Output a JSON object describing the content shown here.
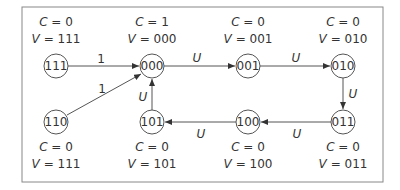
{
  "diagram": {
    "type": "state-transition",
    "frame": {
      "x": 22,
      "y": 7,
      "width": 361,
      "height": 175,
      "stroke": "#888888"
    },
    "nodes": [
      {
        "id": "111",
        "label": "111",
        "x": 56,
        "y": 66,
        "c": "C = 0",
        "v": "V = 111",
        "annot_pos": "above"
      },
      {
        "id": "000",
        "label": "000",
        "x": 152,
        "y": 66,
        "c": "C = 1",
        "v": "V = 000",
        "annot_pos": "above"
      },
      {
        "id": "001",
        "label": "001",
        "x": 248,
        "y": 66,
        "c": "C = 0",
        "v": "V = 001",
        "annot_pos": "above"
      },
      {
        "id": "010",
        "label": "010",
        "x": 343,
        "y": 66,
        "c": "C = 0",
        "v": "V = 010",
        "annot_pos": "above"
      },
      {
        "id": "110",
        "label": "110",
        "x": 56,
        "y": 122,
        "c": "C = 0",
        "v": "V = 111",
        "annot_pos": "below"
      },
      {
        "id": "101",
        "label": "101",
        "x": 152,
        "y": 122,
        "c": "C = 0",
        "v": "V = 101",
        "annot_pos": "below"
      },
      {
        "id": "100",
        "label": "100",
        "x": 248,
        "y": 122,
        "c": "C = 0",
        "v": "V = 100",
        "annot_pos": "below"
      },
      {
        "id": "011",
        "label": "011",
        "x": 343,
        "y": 122,
        "c": "C = 0",
        "v": "V = 011",
        "annot_pos": "below"
      }
    ],
    "edges": [
      {
        "from": "111",
        "to": "000",
        "label": "1"
      },
      {
        "from": "110",
        "to": "000",
        "label": "1"
      },
      {
        "from": "000",
        "to": "001",
        "label": "U"
      },
      {
        "from": "001",
        "to": "010",
        "label": "U"
      },
      {
        "from": "010",
        "to": "011",
        "label": "U"
      },
      {
        "from": "011",
        "to": "100",
        "label": "U"
      },
      {
        "from": "100",
        "to": "101",
        "label": "U"
      },
      {
        "from": "101",
        "to": "000",
        "label": "U"
      }
    ],
    "colors": {
      "line": "#555555",
      "text": "#333333",
      "frame": "#888888"
    }
  }
}
